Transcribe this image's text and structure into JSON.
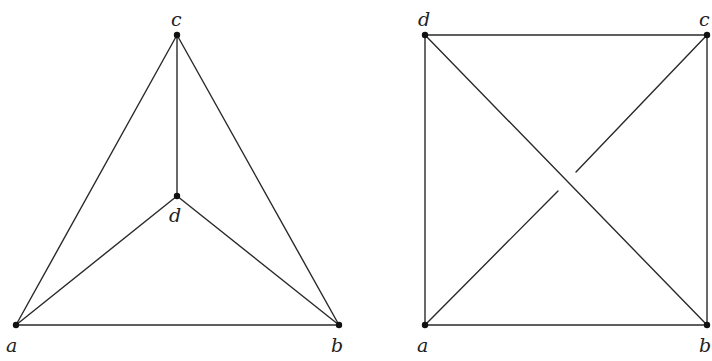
{
  "diagrams": [
    {
      "name": "planar-embedding-K4",
      "vertices": [
        {
          "id": "a",
          "label": "a",
          "x": 16,
          "y": 325,
          "lx": 6,
          "ly": 352
        },
        {
          "id": "b",
          "label": "b",
          "x": 339,
          "y": 325,
          "lx": 331,
          "ly": 352
        },
        {
          "id": "c",
          "label": "c",
          "x": 177,
          "y": 35,
          "lx": 171,
          "ly": 26
        },
        {
          "id": "d",
          "label": "d",
          "x": 177,
          "y": 196,
          "lx": 169,
          "ly": 222
        }
      ],
      "edges": [
        {
          "from": "a",
          "to": "b"
        },
        {
          "from": "a",
          "to": "c"
        },
        {
          "from": "b",
          "to": "c"
        },
        {
          "from": "c",
          "to": "d"
        },
        {
          "from": "a",
          "to": "d"
        },
        {
          "from": "b",
          "to": "d"
        }
      ]
    },
    {
      "name": "square-embedding-K4-with-crossing",
      "vertices": [
        {
          "id": "a",
          "label": "a",
          "x": 425,
          "y": 325,
          "lx": 417,
          "ly": 352
        },
        {
          "id": "b",
          "label": "b",
          "x": 707,
          "y": 325,
          "lx": 699,
          "ly": 352
        },
        {
          "id": "c",
          "label": "c",
          "x": 707,
          "y": 35,
          "lx": 699,
          "ly": 26
        },
        {
          "id": "d",
          "label": "d",
          "x": 425,
          "y": 35,
          "lx": 418,
          "ly": 26
        }
      ],
      "edges": [
        {
          "from": "a",
          "to": "b"
        },
        {
          "from": "b",
          "to": "c"
        },
        {
          "from": "c",
          "to": "d"
        },
        {
          "from": "d",
          "to": "a"
        },
        {
          "from": "d",
          "to": "b"
        }
      ],
      "crossing_edge": {
        "from": "a",
        "to": "c",
        "gap_start": {
          "x": 558,
          "y": 191
        },
        "gap_end": {
          "x": 576,
          "y": 172
        }
      }
    }
  ]
}
